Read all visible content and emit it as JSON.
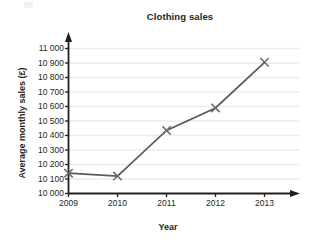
{
  "chart_data": {
    "type": "line",
    "title": "Clothing sales",
    "xlabel": "Year",
    "ylabel": "Average monthly sales (£)",
    "categories": [
      "2009",
      "2010",
      "2011",
      "2012",
      "2013"
    ],
    "x": [
      2009,
      2010,
      2011,
      2012,
      2013
    ],
    "values": [
      10140,
      10120,
      10435,
      10590,
      10905
    ],
    "series": [
      {
        "name": "Average monthly sales",
        "values": [
          10140,
          10120,
          10435,
          10590,
          10905
        ]
      }
    ],
    "ylim": [
      10000,
      11000
    ],
    "xlim": [
      2009,
      2013
    ],
    "ytick_values": [
      10000,
      10100,
      10200,
      10300,
      10400,
      10500,
      10600,
      10700,
      10800,
      10900,
      11000
    ],
    "ytick_labels": [
      "10 000",
      "10 100",
      "10 200",
      "10 300",
      "10 400",
      "10 500",
      "10 600",
      "10 700",
      "10 800",
      "10 900",
      "11 000"
    ],
    "xtick_labels": [
      "2009",
      "2010",
      "2011",
      "2012",
      "2013"
    ],
    "grid": true,
    "grid_axis": "y",
    "legend": false,
    "legend_position": "none",
    "marker": "x",
    "line_color": "#5a5a5a",
    "marker_color": "#6b6b6b",
    "grid_color": "#ededed",
    "axis_color": "#231f20",
    "background_color": "#ffffff",
    "axis_arrows": [
      "y-top",
      "x-right"
    ]
  }
}
